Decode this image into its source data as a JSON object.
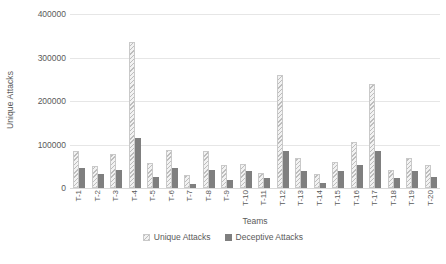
{
  "chart_data": {
    "type": "bar",
    "title": "",
    "xlabel": "Teams",
    "ylabel": "Unique Attacks",
    "ylim": [
      0,
      400000
    ],
    "ytick_labels": [
      "0",
      "100000",
      "200000",
      "300000",
      "400000"
    ],
    "ytick_values": [
      0,
      100000,
      200000,
      300000,
      400000
    ],
    "grid": true,
    "legend_position": "bottom-center",
    "categories": [
      "T-1",
      "T-2",
      "T-3",
      "T-4",
      "T-5",
      "T-6",
      "T-7",
      "T-8",
      "T-9",
      "T-10",
      "T-11",
      "T-12",
      "T-13",
      "T-14",
      "T-15",
      "T-16",
      "T-17",
      "T-18",
      "T-19",
      "T-20"
    ],
    "series": [
      {
        "name": "Unique Attacks",
        "fill": "diagonal-hatch",
        "color": "#bdbdbd",
        "values": [
          85000,
          50000,
          78000,
          335000,
          58000,
          88000,
          30000,
          85000,
          52000,
          55000,
          35000,
          260000,
          70000,
          32000,
          60000,
          105000,
          240000,
          42000,
          70000,
          52000
        ]
      },
      {
        "name": "Deceptive Attacks",
        "fill": "solid",
        "color": "#7f7f7f",
        "values": [
          45000,
          32000,
          42000,
          115000,
          25000,
          45000,
          10000,
          42000,
          18000,
          40000,
          22000,
          85000,
          40000,
          12000,
          38000,
          52000,
          85000,
          22000,
          38000,
          25000
        ]
      }
    ]
  },
  "legend": {
    "items": [
      {
        "label": "Unique Attacks"
      },
      {
        "label": "Deceptive Attacks"
      }
    ]
  }
}
